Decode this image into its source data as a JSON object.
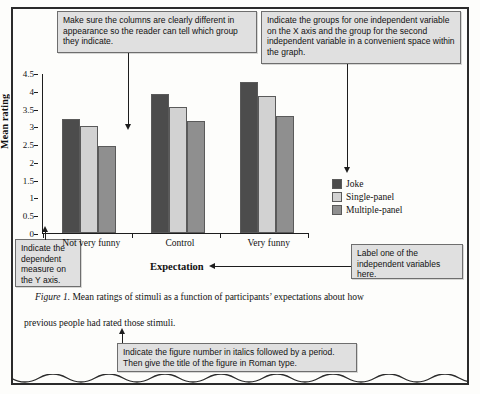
{
  "callouts": {
    "columns": "Make sure the columns are clearly different in appearance so the reader can tell which group they indicate.",
    "groups": "Indicate the groups for one independent variable on the X axis and the group for the second independent variable in a convenient space within the graph.",
    "dependent": "Indicate the dependent measure on the Y axis.",
    "label_iv": "Label one of the independent variables here.",
    "figure_number": "Indicate the figure number in italics followed by a period. Then give the title of the figure in Roman type."
  },
  "caption": {
    "figure_label": "Figure 1.",
    "line1": " Mean ratings of stimuli as a function of participants’ expectations about how",
    "line2": "previous people had rated those stimuli."
  },
  "chart_data": {
    "type": "bar",
    "title": "",
    "xlabel": "Expectation",
    "ylabel": "Mean rating",
    "categories": [
      "Not very funny",
      "Control",
      "Very funny"
    ],
    "series": [
      {
        "name": "Joke",
        "values": [
          3.2,
          3.9,
          4.25
        ],
        "color": "#4c4c4c"
      },
      {
        "name": "Single-panel",
        "values": [
          3.0,
          3.55,
          3.85
        ],
        "color": "#d2d2d2"
      },
      {
        "name": "Multiple-panel",
        "values": [
          2.45,
          3.15,
          3.3
        ],
        "color": "#8f8f8f"
      }
    ],
    "ylim": [
      0,
      4.5
    ],
    "ytick_labels": [
      "4.5",
      "4",
      "3.5",
      "3",
      "2.5",
      "2",
      "1.5",
      "1",
      "0.5",
      "0"
    ],
    "ytick_values": [
      4.5,
      4,
      3.5,
      3,
      2.5,
      2,
      1.5,
      1,
      0.5,
      0
    ],
    "grid": false,
    "legend_position": "right"
  },
  "colors": {
    "callout_fill": "#e0e0e0",
    "callout_border": "#6e6e6e",
    "frame": "#2b2b2b",
    "ink": "#1d1d1d"
  }
}
